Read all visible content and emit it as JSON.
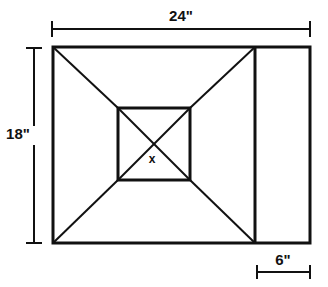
{
  "figure": {
    "stroke_color": "#111111",
    "fill_color": "#ffffff",
    "outer_stroke_width": 3,
    "inner_stroke_width": 3,
    "diagonal_stroke_width": 2,
    "dimension_stroke_width": 2
  },
  "geometry": {
    "outer_rect": {
      "x": 53,
      "y": 47,
      "width": 257,
      "height": 196
    },
    "inner_square": {
      "x": 118,
      "y": 108,
      "width": 72,
      "height": 72
    },
    "divider_line": {
      "x": 255,
      "y1": 47,
      "y2": 243
    },
    "diagonals": [
      {
        "name": "top-left",
        "x1": 53,
        "y1": 47,
        "x2": 118,
        "y2": 108
      },
      {
        "name": "bottom-left",
        "x1": 53,
        "y1": 243,
        "x2": 118,
        "y2": 180
      },
      {
        "name": "top-right",
        "x1": 255,
        "y1": 47,
        "x2": 190,
        "y2": 108
      },
      {
        "name": "bottom-right",
        "x1": 255,
        "y1": 243,
        "x2": 190,
        "y2": 180
      }
    ],
    "inner_diagonals": [
      {
        "name": "inner-nw-se",
        "x1": 118,
        "y1": 108,
        "x2": 190,
        "y2": 180
      },
      {
        "name": "inner-ne-sw",
        "x1": 190,
        "y1": 108,
        "x2": 118,
        "y2": 180
      }
    ]
  },
  "dimensions": {
    "width_top": {
      "label": "24\"",
      "label_x": 181,
      "label_y": 21,
      "line_y": 29,
      "x1": 52,
      "x2": 310,
      "tick_half": 8,
      "tick_orientation": "vertical"
    },
    "height_left": {
      "label": "18\"",
      "label_x": 18,
      "label_y": 139,
      "line_x": 34,
      "y1": 48,
      "y2": 243,
      "tick_half": 8,
      "tick_orientation": "horizontal"
    },
    "strip_bottom": {
      "label": "6\"",
      "label_x": 283,
      "label_y": 265,
      "line_y": 272,
      "x1": 257,
      "x2": 310,
      "tick_half": 7,
      "tick_orientation": "vertical"
    }
  },
  "annotations": {
    "center": {
      "label": "x",
      "x": 152,
      "y": 163
    }
  }
}
